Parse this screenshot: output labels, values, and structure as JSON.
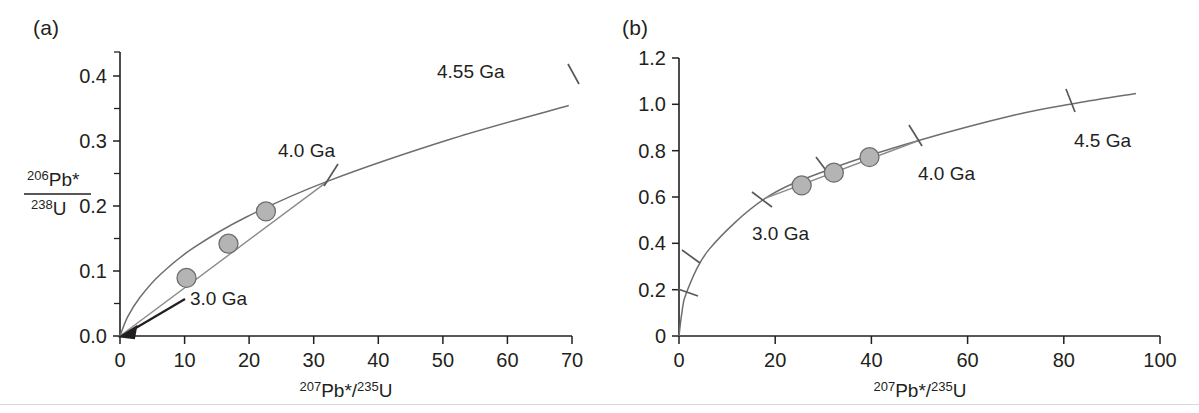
{
  "figure": {
    "caption_type": "concordia-diagram-pair",
    "panels": [
      {
        "id": "a",
        "label": "(a)",
        "xlabel_parts": {
          "sup1": "207",
          "base1": "Pb*/",
          "sup2": "235",
          "base2": "U"
        },
        "ylabel_parts": {
          "num_sup": "206",
          "num_base": "Pb*",
          "den_sup": "238",
          "den_base": "U"
        },
        "x_ticks": [
          "0",
          "10",
          "20",
          "30",
          "40",
          "50",
          "60",
          "70"
        ],
        "y_ticks": [
          "0.0",
          "0.1",
          "0.2",
          "0.3",
          "0.4"
        ],
        "age_labels": [
          "3.0 Ga",
          "4.0 Ga",
          "4.55 Ga"
        ]
      },
      {
        "id": "b",
        "label": "(b)",
        "xlabel_parts": {
          "sup1": "207",
          "base1": "Pb*/",
          "sup2": "235",
          "base2": "U"
        },
        "x_ticks": [
          "0",
          "20",
          "40",
          "60",
          "80",
          "100"
        ],
        "y_ticks": [
          "0",
          "0.2",
          "0.4",
          "0.6",
          "0.8",
          "1.0",
          "1.2"
        ],
        "age_labels": [
          "3.0 Ga",
          "4.0 Ga",
          "4.5 Ga"
        ]
      }
    ]
  },
  "colors": {
    "concordia_curve": "#6e6e70",
    "discordia_line": "#8a8a8c",
    "datapoint_fill": "#b4b4b4",
    "datapoint_stroke": "#6e6e70",
    "axis": "#231f20",
    "background": "#ffffff"
  },
  "chart_data": [
    {
      "type": "scatter",
      "title": "(a) U-Pb concordia diagram, 0-70 range",
      "xlabel": "207Pb*/235U",
      "ylabel": "206Pb*/238U",
      "xlim": [
        0,
        70
      ],
      "ylim": [
        0.0,
        0.44
      ],
      "grid": false,
      "legend": "none",
      "xticks": [
        0,
        10,
        20,
        30,
        40,
        50,
        60,
        70
      ],
      "yticks": [
        0.0,
        0.1,
        0.2,
        0.3,
        0.4
      ],
      "yticks_minor": [
        0.05,
        0.15,
        0.25,
        0.35
      ],
      "series": [
        {
          "name": "concordia curve",
          "kind": "line",
          "x": [
            0.0,
            1.2,
            3.1,
            6.2,
            11.3,
            19.5,
            32.2,
            51.5,
            69.5
          ],
          "y": [
            0.0,
            0.03,
            0.06,
            0.095,
            0.136,
            0.184,
            0.24,
            0.306,
            0.357
          ]
        },
        {
          "name": "discordia chord",
          "kind": "line",
          "x": [
            0.0,
            32.2
          ],
          "y": [
            0.0,
            0.24
          ],
          "lower_intercept_age_ga": 3.0,
          "upper_intercept_age_ga": 4.0
        },
        {
          "name": "analyses",
          "kind": "scatter",
          "x": [
            10.3,
            16.8,
            22.6
          ],
          "y": [
            0.09,
            0.143,
            0.193
          ]
        }
      ],
      "annotations": [
        {
          "text": "3.0 Ga",
          "x": 10.5,
          "y": 0.028,
          "kind": "arrow-to-origin",
          "target_x": 0.0,
          "target_y": 0.0
        },
        {
          "text": "4.0 Ga",
          "x": 26.0,
          "y": 0.295,
          "kind": "age-tick",
          "tick_x": 32.2,
          "tick_y": 0.24
        },
        {
          "text": "4.55 Ga",
          "x": 50.0,
          "y": 0.405,
          "kind": "age-tick",
          "tick_x": 69.5,
          "tick_y": 0.357
        }
      ]
    },
    {
      "type": "scatter",
      "title": "(b) U-Pb concordia diagram, 0-100 range",
      "xlabel": "207Pb*/235U",
      "ylabel": "",
      "xlim": [
        0,
        100
      ],
      "ylim": [
        0,
        1.2
      ],
      "grid": false,
      "legend": "none",
      "xticks": [
        0,
        20,
        40,
        60,
        80,
        100
      ],
      "yticks": [
        0,
        0.2,
        0.4,
        0.6,
        0.8,
        1.0,
        1.2
      ],
      "series": [
        {
          "name": "concordia curve",
          "kind": "line",
          "x": [
            0.0,
            0.6,
            1.6,
            6.3,
            18.0,
            32.0,
            50.0,
            70.0,
            82.5,
            95.0
          ],
          "y": [
            0.0,
            0.1,
            0.19,
            0.375,
            0.595,
            0.725,
            0.845,
            0.955,
            1.005,
            1.047
          ]
        },
        {
          "name": "discordia chord",
          "kind": "line",
          "x": [
            18.0,
            50.0
          ],
          "y": [
            0.595,
            0.845
          ],
          "lower_intercept_age_ga": 3.0,
          "upper_intercept_age_ga": 4.0
        },
        {
          "name": "analyses",
          "kind": "scatter",
          "x": [
            25.5,
            32.2,
            39.6
          ],
          "y": [
            0.65,
            0.705,
            0.772
          ]
        }
      ],
      "age_ticks": [
        {
          "label": "",
          "age_ga": 1.0,
          "x": 1.6,
          "y": 0.19
        },
        {
          "label": "",
          "age_ga": 2.0,
          "x": 6.3,
          "y": 0.375
        },
        {
          "label": "3.0 Ga",
          "age_ga": 3.0,
          "x": 18.0,
          "y": 0.595
        },
        {
          "label": "",
          "age_ga": 3.5,
          "x": 32.0,
          "y": 0.725
        },
        {
          "label": "4.0 Ga",
          "age_ga": 4.0,
          "x": 50.0,
          "y": 0.845
        },
        {
          "label": "4.5 Ga",
          "age_ga": 4.5,
          "x": 82.5,
          "y": 1.005
        }
      ],
      "annotations": [
        {
          "text": "3.0 Ga",
          "x": 22.0,
          "y": 0.475
        },
        {
          "text": "4.0 Ga",
          "x": 56.0,
          "y": 0.705
        },
        {
          "text": "4.5 Ga",
          "x": 84.0,
          "y": 0.875
        }
      ]
    }
  ]
}
